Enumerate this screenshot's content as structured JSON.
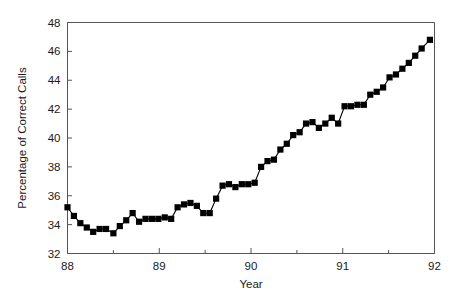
{
  "chart_data": {
    "type": "line",
    "title": "",
    "xlabel": "Year",
    "ylabel": "Percentage of Correct Calls",
    "xlim": [
      88,
      92
    ],
    "ylim": [
      32,
      48
    ],
    "xticks": [
      88,
      89,
      90,
      91,
      92
    ],
    "xticklabels": [
      "88",
      "89",
      "90",
      "91",
      "92"
    ],
    "xminorticks": [
      88.5,
      89.5,
      90.5,
      91.5
    ],
    "yticks": [
      32,
      34,
      36,
      38,
      40,
      42,
      44,
      46,
      48
    ],
    "yticklabels": [
      "32",
      "34",
      "36",
      "38",
      "40",
      "42",
      "44",
      "46",
      "48"
    ],
    "grid": false,
    "legend": false,
    "marker": "square",
    "marker_color": "#000000",
    "line_color": "#000000",
    "series": [
      {
        "name": "Percentage of Correct Calls",
        "x": [
          88.0,
          88.07,
          88.14,
          88.21,
          88.28,
          88.35,
          88.42,
          88.5,
          88.57,
          88.64,
          88.71,
          88.78,
          88.85,
          88.92,
          88.99,
          89.06,
          89.13,
          89.2,
          89.27,
          89.34,
          89.41,
          89.48,
          89.55,
          89.62,
          89.69,
          89.76,
          89.83,
          89.9,
          89.97,
          90.04,
          90.11,
          90.18,
          90.25,
          90.32,
          90.39,
          90.46,
          90.53,
          90.6,
          90.67,
          90.74,
          90.81,
          90.88,
          90.95,
          91.02,
          91.09,
          91.16,
          91.23,
          91.3,
          91.37,
          91.44,
          91.51,
          91.58,
          91.65,
          91.72,
          91.79,
          91.86,
          91.95
        ],
        "y": [
          35.2,
          34.6,
          34.1,
          33.8,
          33.5,
          33.7,
          33.7,
          33.4,
          33.9,
          34.3,
          34.8,
          34.2,
          34.4,
          34.4,
          34.4,
          34.5,
          34.4,
          35.2,
          35.4,
          35.5,
          35.3,
          34.8,
          34.8,
          35.8,
          36.7,
          36.8,
          36.6,
          36.8,
          36.8,
          36.9,
          38.0,
          38.4,
          38.5,
          39.2,
          39.6,
          40.2,
          40.4,
          41.0,
          41.1,
          40.7,
          41.0,
          41.4,
          41.0,
          42.2,
          42.2,
          42.3,
          42.3,
          43.0,
          43.2,
          43.5,
          44.2,
          44.4,
          44.8,
          45.2,
          45.7,
          46.2,
          46.8
        ]
      }
    ]
  }
}
